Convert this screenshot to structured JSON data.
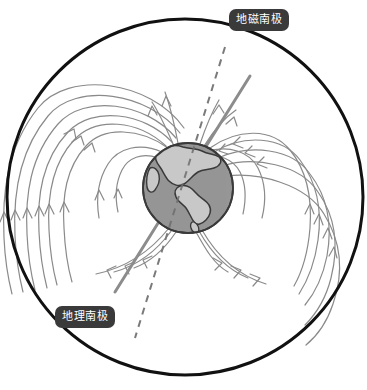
{
  "diagram": {
    "background_color": "#ffffff",
    "labels": [
      {
        "id": "geomagnetic-south-pole",
        "text": "地磁南极",
        "box_color": "#3a3a3a",
        "text_color": "#ffffff",
        "x": 229,
        "y": 9
      },
      {
        "id": "geographic-south-pole",
        "text": "地理南极",
        "box_color": "#3a3a3a",
        "text_color": "#ffffff",
        "x": 55,
        "y": 306
      }
    ],
    "magnetosphere_circle": {
      "name": "magnetosphere-boundary",
      "cx": 185,
      "cy": 197,
      "r": 178,
      "stroke": "#111111",
      "stroke_width": 3,
      "fill": "none"
    },
    "earth": {
      "name": "earth-globe",
      "cx": 188,
      "cy": 188,
      "r": 45,
      "ocean_color": "#969696",
      "land_color": "#c8c8c8",
      "outline_color": "#3a3a3a"
    },
    "rotation_axis": {
      "name": "geographic-axis",
      "style": "dashed",
      "color": "#7a7a7a",
      "stroke_width": 2,
      "dash": "7 6",
      "x1": 225,
      "y1": 47,
      "x2": 135,
      "y2": 338
    },
    "magnetic_axis": {
      "name": "geomagnetic-axis",
      "style": "solid",
      "color": "#8c8c8c",
      "stroke_width": 3,
      "x1": 250,
      "y1": 76,
      "x2": 115,
      "y2": 292
    },
    "field_lines": {
      "name": "magnetic-field-lines",
      "color": "#8a8a8a",
      "stroke_width": 1.2,
      "arrow_color": "#8a8a8a",
      "count": 14,
      "description": "Dipolar magnetic field lines leaving the globe on the upper-left/lower-left and re-entering on the right, with small arrowheads indicating direction."
    }
  }
}
